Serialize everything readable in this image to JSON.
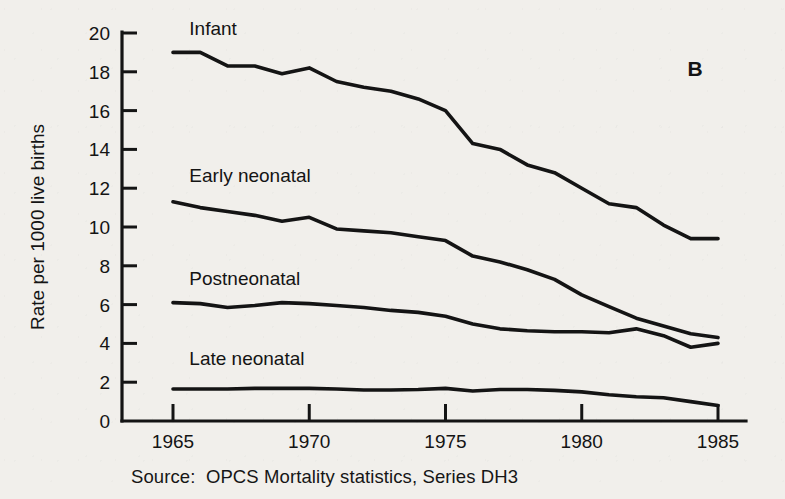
{
  "figure": {
    "panel_label": "B",
    "source_note": "Source:  OPCS Mortality statistics, Series DH3",
    "background_color": "#f1efeb",
    "line_color": "#141414"
  },
  "chart_data": {
    "type": "line",
    "title": "",
    "subtitle": "",
    "xlabel": "",
    "ylabel": "Rate per 1000 live births",
    "xlim": [
      1965,
      1985
    ],
    "ylim": [
      0,
      20
    ],
    "grid": false,
    "legend_position": "inline-labels",
    "x_ticks": [
      1965,
      1970,
      1975,
      1980,
      1985
    ],
    "x_tick_labels": [
      "1965",
      "1970",
      "1975",
      "1980",
      "1985"
    ],
    "y_ticks": [
      0,
      2,
      4,
      6,
      8,
      10,
      12,
      14,
      16,
      18,
      20
    ],
    "y_tick_labels": [
      "0",
      "2",
      "4",
      "6",
      "8",
      "10",
      "12",
      "14",
      "16",
      "18",
      "20"
    ],
    "x": [
      1965,
      1966,
      1967,
      1968,
      1969,
      1970,
      1971,
      1972,
      1973,
      1974,
      1975,
      1976,
      1977,
      1978,
      1979,
      1980,
      1981,
      1982,
      1983,
      1984,
      1985
    ],
    "series": [
      {
        "name": "Infant",
        "label": "Infant",
        "label_x": 1965.6,
        "label_y": 19.9,
        "values": [
          19.0,
          19.0,
          18.3,
          18.3,
          17.9,
          18.2,
          17.5,
          17.2,
          17.0,
          16.6,
          16.0,
          14.3,
          14.0,
          13.2,
          12.8,
          12.0,
          11.2,
          11.0,
          10.1,
          9.4,
          9.4
        ]
      },
      {
        "name": "Early neonatal",
        "label": "Early neonatal",
        "label_x": 1965.6,
        "label_y": 12.3,
        "values": [
          11.3,
          11.0,
          10.8,
          10.6,
          10.3,
          10.5,
          9.9,
          9.8,
          9.7,
          9.5,
          9.3,
          8.5,
          8.2,
          7.8,
          7.3,
          6.5,
          5.9,
          5.3,
          4.9,
          4.5,
          4.3
        ]
      },
      {
        "name": "Postneonatal",
        "label": "Postneonatal",
        "label_x": 1965.6,
        "label_y": 7.0,
        "values": [
          6.1,
          6.05,
          5.85,
          5.95,
          6.1,
          6.05,
          5.95,
          5.85,
          5.7,
          5.6,
          5.4,
          5.0,
          4.75,
          4.65,
          4.6,
          4.6,
          4.55,
          4.75,
          4.4,
          3.8,
          4.0
        ]
      },
      {
        "name": "Late neonatal",
        "label": "Late neonatal",
        "label_x": 1965.6,
        "label_y": 2.9,
        "values": [
          1.65,
          1.65,
          1.65,
          1.68,
          1.68,
          1.68,
          1.65,
          1.6,
          1.6,
          1.62,
          1.68,
          1.55,
          1.62,
          1.62,
          1.58,
          1.5,
          1.35,
          1.25,
          1.2,
          1.0,
          0.8
        ]
      }
    ]
  }
}
